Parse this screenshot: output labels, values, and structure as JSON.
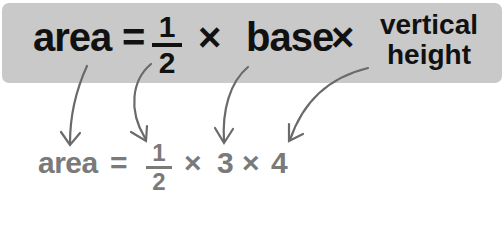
{
  "formula": {
    "lhs": "area",
    "equals": "=",
    "fraction": {
      "numerator": "1",
      "denominator": "2"
    },
    "times1": "×",
    "base": "base",
    "times2": "×",
    "height_line1": "vertical",
    "height_line2": "height"
  },
  "example": {
    "lhs": "area",
    "equals": "=",
    "fraction": {
      "numerator": "1",
      "denominator": "2"
    },
    "times1": "×",
    "base_value": "3",
    "times2": "×",
    "height_value": "4"
  },
  "colors": {
    "box_background": "#c9c9c9",
    "formula_text": "#111111",
    "example_text": "#7a7a7a",
    "arrow": "#6a6a6a"
  }
}
